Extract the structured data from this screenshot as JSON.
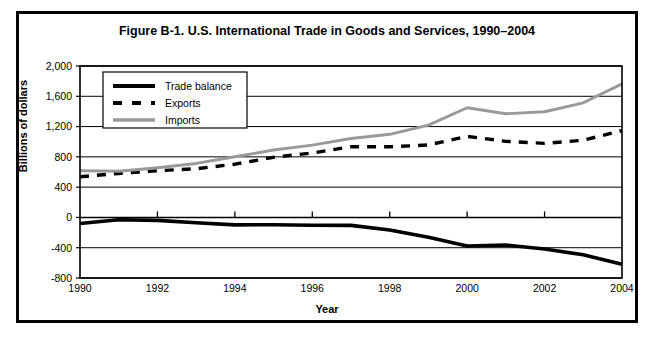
{
  "figure": {
    "title": "Figure B-1. U.S. International Trade in Goods and Services, 1990–2004",
    "xlabel": "Year",
    "ylabel": "Billions of dollars"
  },
  "axes": {
    "y_ticks": [
      "2,000",
      "1,600",
      "1,200",
      "800",
      "400",
      "0",
      "-400",
      "-800"
    ],
    "x_ticks": [
      "1990",
      "1992",
      "1994",
      "1996",
      "1998",
      "2000",
      "2002",
      "2004"
    ]
  },
  "legend": {
    "position": "top-left-inside",
    "items": [
      {
        "label": "Trade balance",
        "style": "solid-thick",
        "color": "#000000"
      },
      {
        "label": "Exports",
        "style": "dashed",
        "color": "#000000"
      },
      {
        "label": "Imports",
        "style": "solid",
        "color": "#999999"
      }
    ]
  },
  "colors": {
    "trade_balance": "#000000",
    "exports": "#000000",
    "imports": "#999999",
    "frame": "#000000",
    "gridline": "#000000"
  },
  "chart_data": {
    "type": "line",
    "title": "Figure B-1. U.S. International Trade in Goods and Services, 1990–2004",
    "xlabel": "Year",
    "ylabel": "Billions of dollars",
    "x": [
      1990,
      1991,
      1992,
      1993,
      1994,
      1995,
      1996,
      1997,
      1998,
      1999,
      2000,
      2001,
      2002,
      2003,
      2004
    ],
    "xlim": [
      1990,
      2004
    ],
    "ylim": [
      -800,
      2000
    ],
    "ytick_step": 400,
    "grid": true,
    "series": [
      {
        "name": "Trade balance",
        "color": "#000000",
        "style": "solid-thick",
        "values": [
          -80,
          -31,
          -39,
          -70,
          -98,
          -96,
          -104,
          -105,
          -165,
          -263,
          -378,
          -365,
          -418,
          -494,
          -618
        ]
      },
      {
        "name": "Exports",
        "color": "#000000",
        "style": "dashed",
        "values": [
          537,
          581,
          617,
          643,
          703,
          794,
          851,
          934,
          933,
          957,
          1071,
          1005,
          978,
          1020,
          1146
        ]
      },
      {
        "name": "Imports",
        "color": "#999999",
        "style": "solid",
        "values": [
          617,
          610,
          656,
          713,
          801,
          890,
          955,
          1042,
          1098,
          1220,
          1449,
          1370,
          1396,
          1514,
          1764
        ]
      }
    ]
  }
}
